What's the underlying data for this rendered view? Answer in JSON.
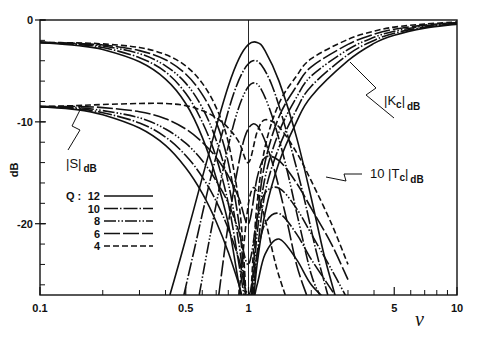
{
  "chart_data": {
    "type": "line",
    "title": "",
    "xlabel": "v",
    "ylabel": "dB",
    "xscale": "log",
    "xlim": [
      0.1,
      10
    ],
    "ylim": [
      -27,
      0
    ],
    "x_ticks": [
      {
        "value": 0.1,
        "label": "0.1"
      },
      {
        "value": 0.5,
        "label": "0.5"
      },
      {
        "value": 1,
        "label": "1"
      },
      {
        "value": 5,
        "label": "5"
      },
      {
        "value": 10,
        "label": "10"
      }
    ],
    "x_minor_ticks": [
      0.2,
      0.3,
      0.4,
      0.6,
      0.7,
      0.8,
      0.9,
      2,
      3,
      4,
      6,
      7,
      8,
      9
    ],
    "y_ticks": [
      {
        "value": 0,
        "label": "0"
      },
      {
        "value": -10,
        "label": "-10"
      },
      {
        "value": -20,
        "label": "-20"
      }
    ],
    "y_minor_step": 2,
    "reference_line_x": 1,
    "grid": false,
    "legend": {
      "placement": "left-center",
      "title": "Q :",
      "entries": [
        {
          "label": "12",
          "style": "solid"
        },
        {
          "label": "10",
          "style": "dash-dot"
        },
        {
          "label": "8",
          "style": "dash-dot-dot"
        },
        {
          "label": "6",
          "style": "long-dash"
        },
        {
          "label": "4",
          "style": "dashed"
        }
      ]
    },
    "annotations": [
      {
        "text": "|K",
        "sub": "c",
        "tail": "|",
        "unit": "dB",
        "points_to": "Kc curves, right side",
        "at_v": 3.5
      },
      {
        "text": "|S|",
        "sub": "",
        "tail": "",
        "unit": "dB",
        "points_to": "S curves, left side",
        "at_v": 0.2
      },
      {
        "text": "10 |T",
        "sub": "c",
        "tail": "|",
        "unit": "dB",
        "points_to": "Tc curves, center",
        "at_v": 1.7
      }
    ],
    "series": [
      {
        "name": "|Kc| Q=12",
        "family": "Kc",
        "q": 12,
        "x": [
          0.1,
          0.15,
          0.2,
          0.3,
          0.4,
          0.5,
          0.6,
          0.7,
          0.8,
          0.9,
          0.95,
          1.0,
          1.05,
          1.1,
          1.2,
          1.4,
          1.7,
          2,
          3,
          4,
          5,
          7,
          10
        ],
        "y": [
          -2.2,
          -2.5,
          -2.9,
          -4.1,
          -5.8,
          -8.2,
          -11.5,
          -15.5,
          -20,
          -26,
          -28,
          -30,
          -28,
          -24,
          -19,
          -14,
          -10,
          -7.5,
          -4,
          -2.3,
          -1.5,
          -0.8,
          -0.4
        ]
      },
      {
        "name": "|Kc| Q=10",
        "family": "Kc",
        "q": 10,
        "x": [
          0.1,
          0.15,
          0.2,
          0.3,
          0.4,
          0.5,
          0.6,
          0.7,
          0.8,
          0.9,
          0.95,
          1.0,
          1.05,
          1.1,
          1.2,
          1.4,
          1.7,
          2,
          3,
          4,
          5,
          7,
          10
        ],
        "y": [
          -2.2,
          -2.4,
          -2.7,
          -3.7,
          -5.1,
          -7.2,
          -10,
          -13.5,
          -18,
          -24,
          -27,
          -30,
          -27,
          -23,
          -17,
          -12.5,
          -8.8,
          -6.5,
          -3.4,
          -2,
          -1.3,
          -0.7,
          -0.35
        ]
      },
      {
        "name": "|Kc| Q=8",
        "family": "Kc",
        "q": 8,
        "x": [
          0.1,
          0.15,
          0.2,
          0.3,
          0.4,
          0.5,
          0.6,
          0.7,
          0.8,
          0.9,
          0.95,
          1.0,
          1.05,
          1.1,
          1.2,
          1.4,
          1.7,
          2,
          3,
          4,
          5,
          7,
          10
        ],
        "y": [
          -2.2,
          -2.35,
          -2.55,
          -3.3,
          -4.5,
          -6.2,
          -8.6,
          -11.8,
          -16,
          -22,
          -26,
          -30,
          -26,
          -21,
          -15.5,
          -11,
          -7.6,
          -5.5,
          -2.9,
          -1.7,
          -1.1,
          -0.6,
          -0.3
        ]
      },
      {
        "name": "|Kc| Q=6",
        "family": "Kc",
        "q": 6,
        "x": [
          0.1,
          0.15,
          0.2,
          0.3,
          0.4,
          0.5,
          0.6,
          0.7,
          0.8,
          0.9,
          0.95,
          1.0,
          1.05,
          1.1,
          1.2,
          1.4,
          1.7,
          2,
          3,
          4,
          5,
          7,
          10
        ],
        "y": [
          -2.2,
          -2.3,
          -2.45,
          -3.0,
          -3.9,
          -5.3,
          -7.3,
          -10,
          -14,
          -20,
          -25,
          -30,
          -25,
          -19.5,
          -14,
          -9.5,
          -6.5,
          -4.6,
          -2.4,
          -1.4,
          -0.9,
          -0.5,
          -0.25
        ]
      },
      {
        "name": "|Kc| Q=4",
        "family": "Kc",
        "q": 4,
        "x": [
          0.1,
          0.15,
          0.2,
          0.3,
          0.4,
          0.5,
          0.6,
          0.7,
          0.8,
          0.9,
          0.95,
          1.0,
          1.05,
          1.1,
          1.2,
          1.4,
          1.7,
          2,
          3,
          4,
          5,
          7,
          10
        ],
        "y": [
          -2.2,
          -2.25,
          -2.35,
          -2.7,
          -3.4,
          -4.5,
          -6.2,
          -8.6,
          -12,
          -18,
          -23.5,
          -30,
          -23.5,
          -18,
          -12.5,
          -8.2,
          -5.5,
          -3.8,
          -1.9,
          -1.1,
          -0.7,
          -0.4,
          -0.2
        ]
      },
      {
        "name": "|S| Q=12",
        "family": "S",
        "q": 12,
        "x": [
          0.1,
          0.15,
          0.2,
          0.3,
          0.4,
          0.5,
          0.6,
          0.7,
          0.8,
          0.9,
          1.0,
          1.1,
          1.2,
          1.4,
          1.7,
          2,
          2.5,
          3
        ],
        "y": [
          -8.5,
          -8.8,
          -9.3,
          -10.6,
          -12.3,
          -14.5,
          -17,
          -19.8,
          -22.8,
          -26,
          -29,
          -26,
          -23,
          -21.5,
          -23.5,
          -26,
          -28,
          -30
        ]
      },
      {
        "name": "|S| Q=10",
        "family": "S",
        "q": 10,
        "x": [
          0.1,
          0.15,
          0.2,
          0.3,
          0.4,
          0.5,
          0.6,
          0.7,
          0.8,
          0.9,
          1.0,
          1.1,
          1.2,
          1.4,
          1.7,
          2,
          2.5,
          3
        ],
        "y": [
          -8.5,
          -8.7,
          -9.1,
          -10.1,
          -11.5,
          -13.3,
          -15.4,
          -17.8,
          -20.5,
          -23.5,
          -27,
          -23,
          -20,
          -19,
          -21,
          -23.5,
          -26.5,
          -29
        ]
      },
      {
        "name": "|S| Q=8",
        "family": "S",
        "q": 8,
        "x": [
          0.1,
          0.15,
          0.2,
          0.3,
          0.4,
          0.5,
          0.6,
          0.7,
          0.8,
          0.9,
          1.0,
          1.1,
          1.2,
          1.4,
          1.7,
          2,
          2.5,
          3
        ],
        "y": [
          -8.5,
          -8.6,
          -8.9,
          -9.6,
          -10.7,
          -12.1,
          -13.8,
          -15.8,
          -18,
          -20.8,
          -24,
          -19.5,
          -17,
          -16.5,
          -18.5,
          -21,
          -24.5,
          -27.5
        ]
      },
      {
        "name": "|S| Q=6",
        "family": "S",
        "q": 6,
        "x": [
          0.1,
          0.15,
          0.2,
          0.3,
          0.4,
          0.5,
          0.6,
          0.7,
          0.8,
          0.9,
          1.0,
          1.1,
          1.2,
          1.4,
          1.7,
          2,
          2.5,
          3
        ],
        "y": [
          -8.5,
          -8.5,
          -8.6,
          -9.0,
          -9.7,
          -10.7,
          -12,
          -13.5,
          -15.3,
          -17.5,
          -20,
          -15.5,
          -13.5,
          -13.8,
          -16,
          -18.5,
          -22,
          -25.5
        ]
      },
      {
        "name": "|S| Q=4",
        "family": "S",
        "q": 4,
        "x": [
          0.1,
          0.15,
          0.2,
          0.3,
          0.4,
          0.5,
          0.6,
          0.7,
          0.8,
          0.9,
          1.0,
          1.1,
          1.2,
          1.4,
          1.7,
          2,
          2.5,
          3
        ],
        "y": [
          -8.5,
          -8.4,
          -8.3,
          -8.2,
          -8.2,
          -8.4,
          -8.9,
          -9.6,
          -10.6,
          -12,
          -14,
          -11,
          -9.8,
          -10.5,
          -13,
          -15.8,
          -20,
          -24
        ]
      },
      {
        "name": "10|Tc| Q=12",
        "family": "Tc",
        "q": 12,
        "x": [
          0.42,
          0.5,
          0.6,
          0.7,
          0.8,
          0.9,
          1.0,
          1.1,
          1.2,
          1.4,
          1.7,
          2.0,
          2.3,
          2.6
        ],
        "y": [
          -27,
          -21.5,
          -15.5,
          -10.5,
          -6.5,
          -3.8,
          -2.4,
          -2.2,
          -3.0,
          -6,
          -11.5,
          -17.5,
          -23,
          -27
        ]
      },
      {
        "name": "10|Tc| Q=10",
        "family": "Tc",
        "q": 10,
        "x": [
          0.49,
          0.55,
          0.65,
          0.75,
          0.85,
          0.95,
          1.05,
          1.15,
          1.3,
          1.5,
          1.8,
          2.1,
          2.4
        ],
        "y": [
          -27,
          -22.5,
          -16,
          -11,
          -7.2,
          -4.9,
          -4.0,
          -4.4,
          -6.5,
          -10.5,
          -16.5,
          -22.5,
          -27
        ]
      },
      {
        "name": "10|Tc| Q=8",
        "family": "Tc",
        "q": 8,
        "x": [
          0.58,
          0.65,
          0.75,
          0.85,
          0.95,
          1.05,
          1.15,
          1.3,
          1.5,
          1.75,
          2.0,
          2.2
        ],
        "y": [
          -27,
          -21.5,
          -15,
          -10.2,
          -7.3,
          -6.2,
          -6.8,
          -9.5,
          -14,
          -20,
          -25,
          -27
        ]
      },
      {
        "name": "10|Tc| Q=6",
        "family": "Tc",
        "q": 6,
        "x": [
          0.72,
          0.8,
          0.88,
          0.96,
          1.05,
          1.15,
          1.3,
          1.5,
          1.7,
          1.9
        ],
        "y": [
          -27,
          -20,
          -15,
          -11.5,
          -10.2,
          -11,
          -14,
          -19,
          -24,
          -27
        ]
      },
      {
        "name": "10|Tc| Q=4",
        "family": "Tc",
        "q": 4,
        "x": [
          0.9,
          0.95,
          1.0,
          1.05,
          1.1,
          1.2,
          1.35,
          1.5
        ],
        "y": [
          -27,
          -22,
          -18,
          -16.5,
          -17,
          -19.5,
          -24,
          -27
        ]
      }
    ]
  }
}
